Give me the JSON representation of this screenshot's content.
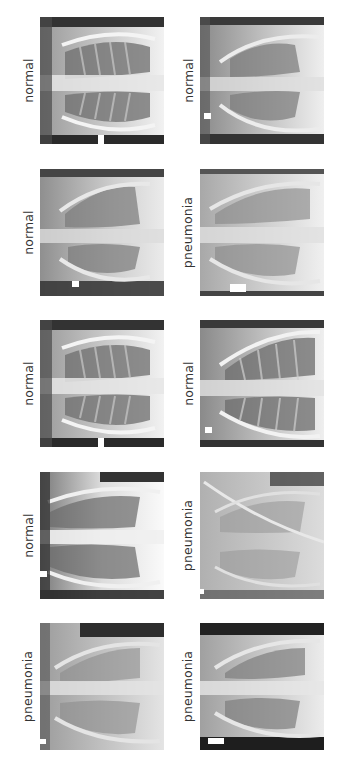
{
  "figure": {
    "layout": {
      "rows": 5,
      "cols": 2
    },
    "images": [
      {
        "row": 0,
        "col": 0,
        "label": "normal",
        "style": "normal-a",
        "marker": "bottom"
      },
      {
        "row": 0,
        "col": 1,
        "label": "normal",
        "style": "normal-b",
        "marker": "left"
      },
      {
        "row": 1,
        "col": 0,
        "label": "normal",
        "style": "normal-c",
        "marker": "bottom-left"
      },
      {
        "row": 1,
        "col": 1,
        "label": "pneumonia",
        "style": "pneumonia-a",
        "marker": "bottom"
      },
      {
        "row": 2,
        "col": 0,
        "label": "normal",
        "style": "normal-a",
        "marker": "bottom"
      },
      {
        "row": 2,
        "col": 1,
        "label": "normal",
        "style": "normal-d",
        "marker": "left"
      },
      {
        "row": 3,
        "col": 0,
        "label": "normal",
        "style": "normal-e",
        "marker": "left"
      },
      {
        "row": 3,
        "col": 1,
        "label": "pneumonia",
        "style": "pneumonia-b",
        "marker": "left"
      },
      {
        "row": 4,
        "col": 0,
        "label": "pneumonia",
        "style": "pneumonia-c",
        "marker": "left"
      },
      {
        "row": 4,
        "col": 1,
        "label": "pneumonia",
        "style": "pneumonia-d",
        "marker": "left"
      }
    ]
  }
}
